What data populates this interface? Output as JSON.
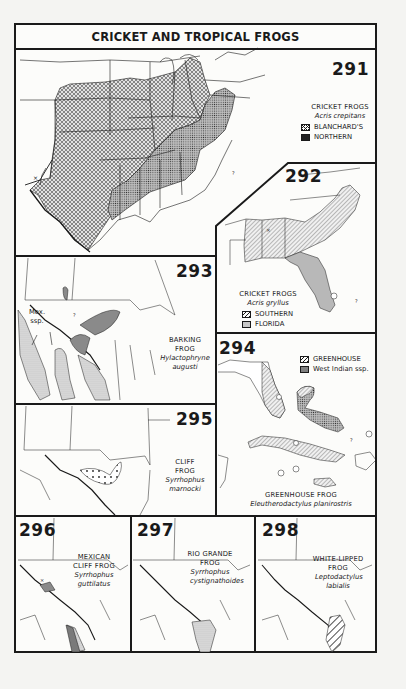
{
  "page": {
    "title": "CRICKET AND TROPICAL FROGS"
  },
  "colors": {
    "ink": "#1a1a1a",
    "paper": "#fcfcfa",
    "fill_gray": "#9a9a9a",
    "fill_light": "#cfcfcf"
  },
  "maps": [
    {
      "number": "291",
      "common_name": "CRICKET FROGS",
      "scientific_name": "Acris crepitans",
      "legend": [
        {
          "label": "BLANCHARD'S",
          "pattern": "crosshatch"
        },
        {
          "label": "NORTHERN",
          "pattern": "stipple"
        }
      ],
      "markers": [
        "x",
        "?"
      ]
    },
    {
      "number": "292",
      "common_name": "CRICKET FROGS",
      "scientific_name": "Acris gryllus",
      "legend": [
        {
          "label": "SOUTHERN",
          "pattern": "hatch"
        },
        {
          "label": "FLORIDA",
          "pattern": "gray"
        }
      ],
      "markers": [
        "x",
        "?"
      ]
    },
    {
      "number": "293",
      "common_name": "BARKING FROG",
      "scientific_name": "Hylactophryne augusti",
      "annotation_1": "Mex.",
      "annotation_2": "ssp.",
      "markers": [
        "?"
      ]
    },
    {
      "number": "294",
      "common_name": "GREENHOUSE FROG",
      "scientific_name": "Eleutherodactylus planirostris",
      "legend": [
        {
          "label": "GREENHOUSE",
          "pattern": "hatch"
        },
        {
          "label": "West Indian ssp.",
          "pattern": "stipple"
        }
      ],
      "markers": [
        "?"
      ]
    },
    {
      "number": "295",
      "common_name": "CLIFF FROG",
      "scientific_name": "Syrrhophus marnocki"
    },
    {
      "number": "296",
      "common_name": "MEXICAN CLIFF FROG",
      "scientific_name": "Syrrhophus guttilatus",
      "markers": [
        "x"
      ]
    },
    {
      "number": "297",
      "common_name": "RIO GRANDE FROG",
      "scientific_name": "Syrrhophus cystignathoides"
    },
    {
      "number": "298",
      "common_name": "WHITE-LIPPED FROG",
      "scientific_name": "Leptodactylus labialis"
    }
  ]
}
